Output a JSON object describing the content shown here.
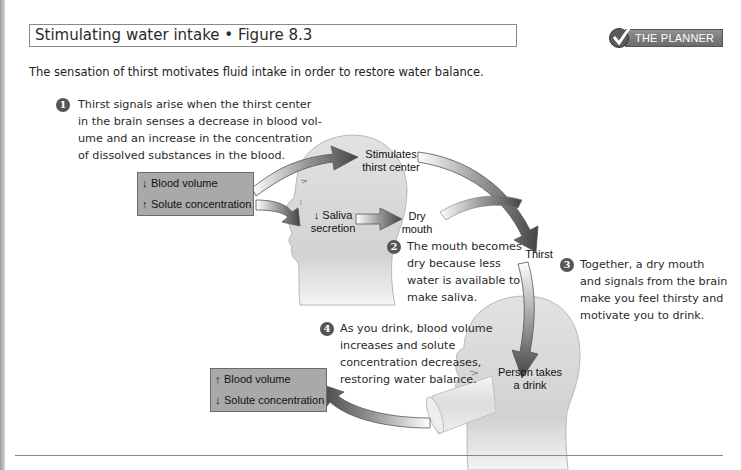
{
  "header": {
    "title": "Stimulating water intake • Figure 8.3",
    "planner_label": "THE PLANNER",
    "subtitle": "The sensation of thirst motivates fluid intake in order to restore water balance."
  },
  "steps": [
    {
      "num": "1",
      "text": "Thirst signals arise when the thirst center\nin the brain senses a decrease in blood vol-\nume and an increase in the concentration\nof dissolved substances in the blood."
    },
    {
      "num": "2",
      "text": "The mouth becomes\ndry because less\nwater is available to\nmake saliva."
    },
    {
      "num": "3",
      "text": "Together, a dry mouth\nand signals from the brain\nmake you feel thirsty and\nmotivate you to drink."
    },
    {
      "num": "4",
      "text": "As you drink, blood volume\nincreases and solute\nconcentration decreases,\nrestoring water balance."
    }
  ],
  "initial_state": {
    "rows": [
      {
        "arrow": "↓",
        "direction": "down",
        "label": "Blood volume"
      },
      {
        "arrow": "↑",
        "direction": "up",
        "label": "Solute concentration"
      }
    ]
  },
  "final_state": {
    "rows": [
      {
        "arrow": "↑",
        "direction": "up",
        "label": "Blood volume"
      },
      {
        "arrow": "↓",
        "direction": "down",
        "label": "Solute concentration"
      }
    ]
  },
  "labels": {
    "stimulates": "Stimulates\nthirst center",
    "saliva": "↓ Saliva\nsecretion",
    "dry_mouth": "Dry\nmouth",
    "thirst": "Thirst",
    "person_drinks": "Person takes\na drink"
  },
  "colors": {
    "box_fill": "#a9a9a9",
    "head_fill": "#d8d8d8",
    "arrow_dark": "#4a4a4a",
    "step_badge": "#555555"
  }
}
